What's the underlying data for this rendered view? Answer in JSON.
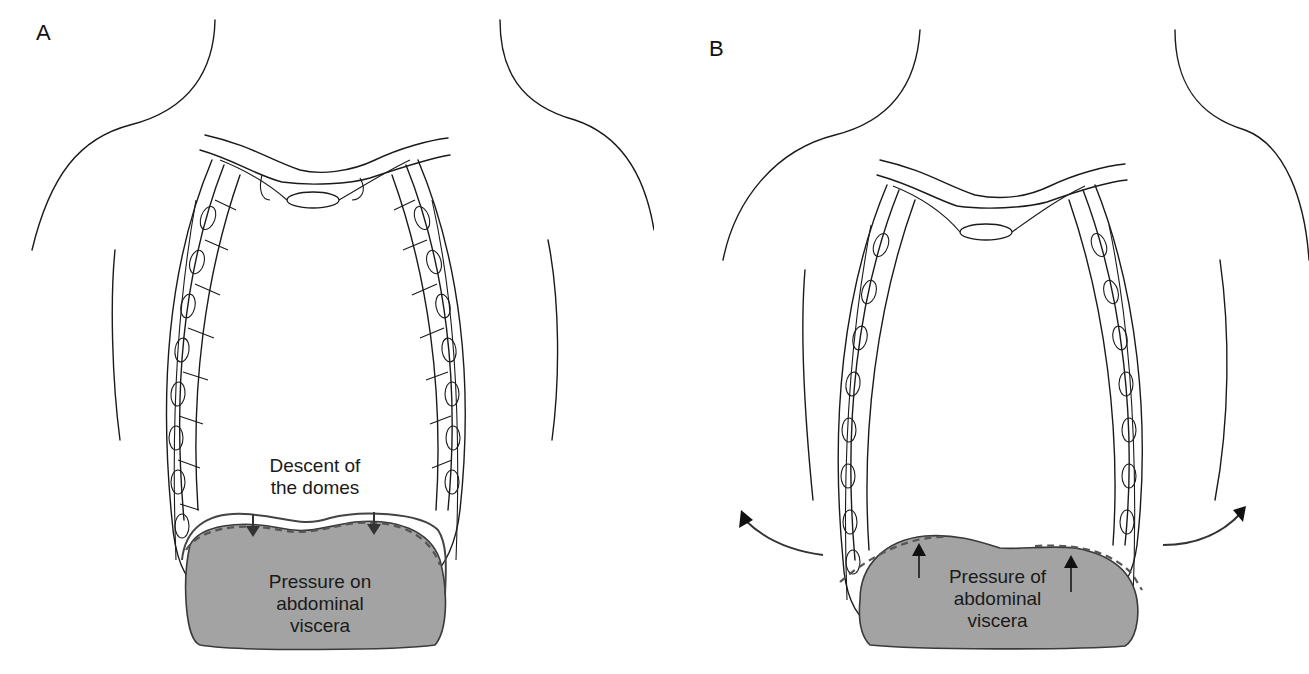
{
  "figure": {
    "panels": [
      {
        "id": "A",
        "letter": "A",
        "annotation_top": [
          "Descent of",
          "the domes"
        ],
        "viscera_label": [
          "Pressure on",
          "abdominal",
          "viscera"
        ],
        "arrows": "downward arrows on diaphragm domes",
        "dashed_line": "lowered diaphragm position"
      },
      {
        "id": "B",
        "letter": "B",
        "viscera_label": [
          "Pressure of",
          "abdominal",
          "viscera"
        ],
        "arrows": "upward arrows from viscera; curved arrows showing lateral rib flaring",
        "dashed_line": "previous diaphragm/rib position"
      }
    ],
    "colors": {
      "viscera_fill": "#a3a3a3",
      "line": "#1a1a1a",
      "background": "#ffffff"
    }
  }
}
